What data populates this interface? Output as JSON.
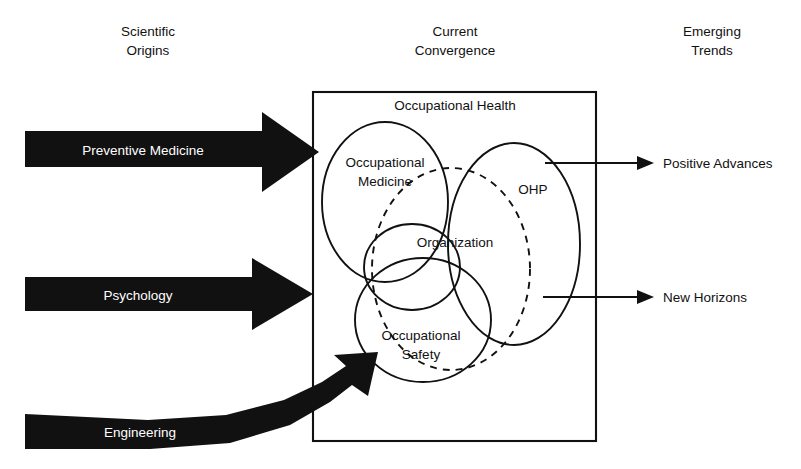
{
  "columns": {
    "left": {
      "line1": "Scientific",
      "line2": "Origins"
    },
    "center": {
      "line1": "Current",
      "line2": "Convergence"
    },
    "right": {
      "line1": "Emerging",
      "line2": "Trends"
    }
  },
  "inputs": [
    {
      "label": "Preventive Medicine",
      "shape": "straight-arrow"
    },
    {
      "label": "Psychology",
      "shape": "straight-arrow"
    },
    {
      "label": "Engineering",
      "shape": "curved-arrow"
    }
  ],
  "container": {
    "title": "Occupational Health"
  },
  "sets": [
    {
      "label_line1": "Occupational",
      "label_line2": "Medicine",
      "style": "solid"
    },
    {
      "label_line1": "OHP",
      "label_line2": "",
      "style": "solid"
    },
    {
      "label_line1": "Organization",
      "label_line2": "",
      "style": "solid"
    },
    {
      "label_line1": "Occupational",
      "label_line2": "Safety",
      "style": "solid"
    },
    {
      "label_line1": "",
      "label_line2": "",
      "style": "dashed"
    }
  ],
  "outputs": [
    {
      "label": "Positive Advances"
    },
    {
      "label": "New Horizons"
    }
  ],
  "colors": {
    "ink": "#111111",
    "paper": "#ffffff",
    "arrow_fill": "#111111",
    "arrow_text": "#ffffff"
  }
}
